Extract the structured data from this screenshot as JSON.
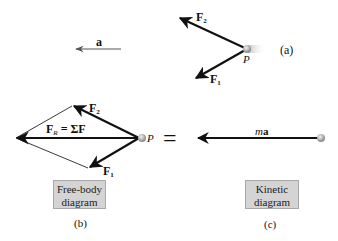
{
  "figure": {
    "panel_a": {
      "acceleration_label": "a",
      "force_2_label": "F",
      "force_2_sub": "2",
      "force_1_label": "F",
      "force_1_sub": "1",
      "particle_label": "P",
      "caption": "(a)"
    },
    "panel_b": {
      "resultant_label": "F",
      "resultant_sub": "R",
      "resultant_eq": " = ΣF",
      "force_2_label": "F",
      "force_2_sub": "2",
      "force_1_label": "F",
      "force_1_sub": "1",
      "particle_label": "P",
      "box_line1": "Free-body",
      "box_line2": "diagram",
      "caption": "(b)"
    },
    "equals_sign": "=",
    "panel_c": {
      "vector_label_m": "m",
      "vector_label_a": "a",
      "box_line1": "Kinetic",
      "box_line2": "diagram",
      "caption": "(c)"
    },
    "colors": {
      "arrow": "#111111",
      "thin_line": "#222222",
      "box_fill": "#d4d4d4",
      "particle": "#b8b8b8"
    }
  }
}
